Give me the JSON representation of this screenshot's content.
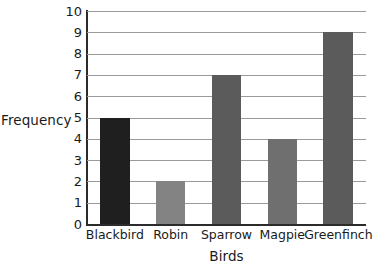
{
  "chart_data": {
    "type": "bar",
    "title": "",
    "xlabel": "Birds",
    "ylabel": "Frequency",
    "categories": [
      "Blackbird",
      "Robin",
      "Sparrow",
      "Magpie",
      "Greenfinch"
    ],
    "values": [
      5,
      2,
      7,
      4,
      9
    ],
    "ylim": [
      0,
      10
    ],
    "ytick_labels": [
      "0",
      "1",
      "2",
      "3",
      "4",
      "5",
      "6",
      "7",
      "8",
      "9",
      "10"
    ],
    "ytick_values": [
      0,
      1,
      2,
      3,
      4,
      5,
      6,
      7,
      8,
      9,
      10
    ],
    "grid": "horizontal",
    "legend": "none",
    "bar_colors": [
      "#1f1f1f",
      "#838383",
      "#5b5b5b",
      "#6f6f6f",
      "#5b5b5b"
    ],
    "axis_color": "#2b2b2b",
    "gridline_color": "#9a9a9a",
    "background_color": "#ffffff"
  }
}
